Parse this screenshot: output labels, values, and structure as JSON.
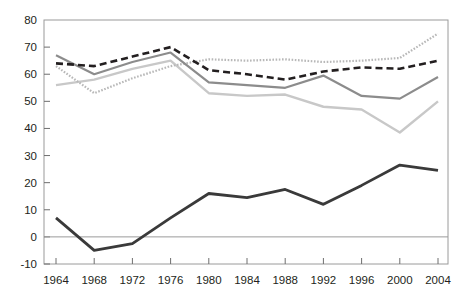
{
  "chart_data": {
    "type": "line",
    "title": "",
    "subtitle": "",
    "xlabel": "",
    "ylabel": "",
    "categories": [
      1964,
      1968,
      1972,
      1976,
      1980,
      1984,
      1988,
      1992,
      1996,
      2000,
      2004
    ],
    "x_tick_labels": [
      "1964",
      "1968",
      "1972",
      "1976",
      "1980",
      "1984",
      "1988",
      "1992",
      "1996",
      "2000",
      "2004"
    ],
    "y_tick_labels": [
      "80",
      "70",
      "60",
      "50",
      "40",
      "30",
      "20",
      "10",
      "0",
      "-10"
    ],
    "y_ticks": [
      80,
      70,
      60,
      50,
      40,
      30,
      20,
      10,
      0,
      -10
    ],
    "ylim": [
      -10,
      80
    ],
    "xlim": [
      1964,
      2004
    ],
    "grid": false,
    "legend": "none",
    "zero_line": 0,
    "series": [
      {
        "name": "series-dotted",
        "style": "dotted",
        "color": "#b8b8b8",
        "width": 2.2,
        "values": [
          63,
          53,
          58.5,
          63,
          65.5,
          65,
          65.5,
          64.5,
          65,
          66,
          75
        ]
      },
      {
        "name": "series-dashed",
        "style": "dashed",
        "color": "#231f20",
        "width": 2.6,
        "values": [
          64,
          63,
          66.5,
          70,
          61.5,
          60,
          58,
          61,
          62.5,
          62,
          65
        ]
      },
      {
        "name": "series-solid-dark-gray",
        "style": "solid",
        "color": "#8c8c8c",
        "width": 2.2,
        "values": [
          67,
          60,
          64.5,
          68,
          57,
          56,
          55,
          59.5,
          52,
          51,
          59
        ]
      },
      {
        "name": "series-solid-light-gray",
        "style": "solid",
        "color": "#c8c8c8",
        "width": 2.4,
        "values": [
          56,
          58,
          62,
          65,
          53,
          52,
          52.5,
          48,
          47,
          38.5,
          50
        ]
      },
      {
        "name": "series-solid-black",
        "style": "solid",
        "color": "#3a3a3a",
        "width": 2.8,
        "values": [
          7,
          -5,
          -2.5,
          7,
          16,
          14.5,
          17.5,
          12,
          19,
          26.5,
          24.5
        ]
      }
    ]
  },
  "axis": {
    "frame_color": "#9a9a9a",
    "zero_line_color": "#9a9a9a",
    "tick_color": "#6e6e6e",
    "label_color": "#231f20"
  }
}
